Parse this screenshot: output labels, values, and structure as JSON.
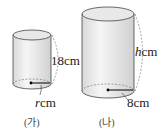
{
  "figures": [
    {
      "caption": "(가)",
      "height_label": "18",
      "radius_var": "r",
      "unit": "cm"
    },
    {
      "caption": "(나)",
      "height_var": "h",
      "radius_label": "8",
      "unit": "cm"
    }
  ]
}
